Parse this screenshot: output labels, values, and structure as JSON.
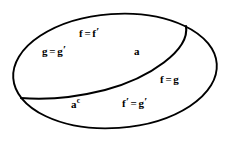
{
  "diagram": {
    "type": "set-partition-ellipse",
    "title": "",
    "outer_shape": "ellipse",
    "divider": "curve",
    "stroke_color": "#000000",
    "fill_color": "#ffffff",
    "background_color": "#ffffff",
    "regions": [
      {
        "id": "upper-left",
        "name": "a",
        "labels": [
          "f = f'",
          "g = g'",
          "a"
        ]
      },
      {
        "id": "lower-right",
        "name": "a-complement",
        "labels": [
          "f = g",
          "f' = g'",
          "a^c"
        ]
      }
    ],
    "labels": {
      "f_eq_f_prime": {
        "lhs": "f",
        "eq": "=",
        "rhs": "f",
        "rhs_prime": "′"
      },
      "g_eq_g_prime": {
        "lhs": "g",
        "eq": "=",
        "rhs": "g",
        "rhs_prime": "′"
      },
      "a": {
        "text": "a"
      },
      "f_eq_g": {
        "lhs": "f",
        "eq": "=",
        "rhs": "g"
      },
      "a_complement": {
        "base": "a",
        "superscript": "c"
      },
      "f_prime_eq_g_prime": {
        "lhs": "f",
        "lhs_prime": "′",
        "eq": "=",
        "rhs": "g",
        "rhs_prime": "′"
      }
    }
  }
}
